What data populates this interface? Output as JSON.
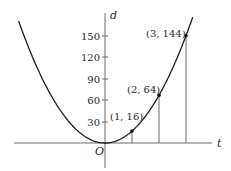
{
  "chart_data": {
    "type": "line",
    "title": "",
    "function": "d = 16t^2",
    "xlabel": "t",
    "ylabel": "d",
    "origin_label": "O",
    "yticks": [
      30,
      60,
      90,
      120,
      150
    ],
    "ytick_labels": [
      "30",
      "60",
      "90",
      "120",
      "150"
    ],
    "xlim": [
      -3.3,
      3.9
    ],
    "ylim": [
      -30,
      175
    ],
    "grid": false,
    "legend": null,
    "points": [
      {
        "t": 1,
        "d": 16,
        "label": "(1, 16)"
      },
      {
        "t": 2,
        "d": 64,
        "label": "(2, 64)"
      },
      {
        "t": 3,
        "d": 144,
        "label": "(3, 144)"
      }
    ],
    "curve_t_range": [
      -3.2,
      3.25
    ],
    "colors": {
      "curve": "#1e1e1e",
      "axis": "#6a6a6a",
      "drop_lines": "#6a6a6a",
      "text": "#2a2a2a"
    }
  }
}
